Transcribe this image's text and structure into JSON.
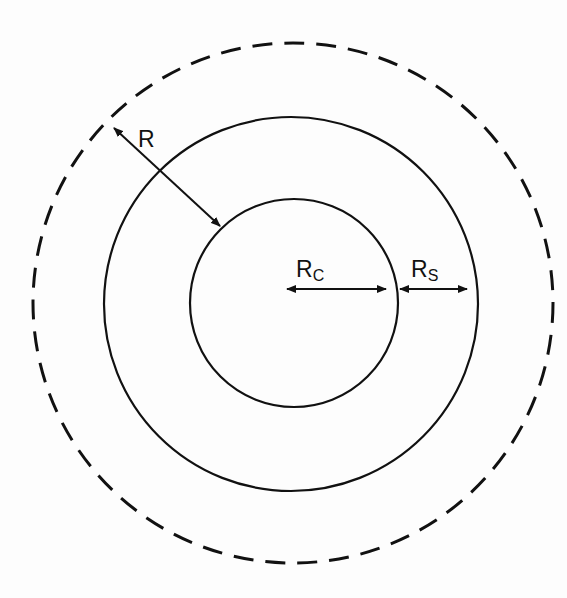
{
  "diagram": {
    "type": "concentric-circles",
    "center": [
      292,
      303
    ],
    "circles": [
      {
        "name": "core",
        "radius": 104,
        "style": "solid"
      },
      {
        "name": "shell",
        "radius": 187,
        "style": "solid"
      },
      {
        "name": "outer-boundary",
        "radius": 260,
        "style": "dashed"
      }
    ],
    "labels": {
      "R": "R",
      "Rc_main": "R",
      "Rc_sub": "C",
      "Rs_main": "R",
      "Rs_sub": "S"
    },
    "colors": {
      "stroke": "#111111",
      "background": "#fdfdfd"
    }
  }
}
